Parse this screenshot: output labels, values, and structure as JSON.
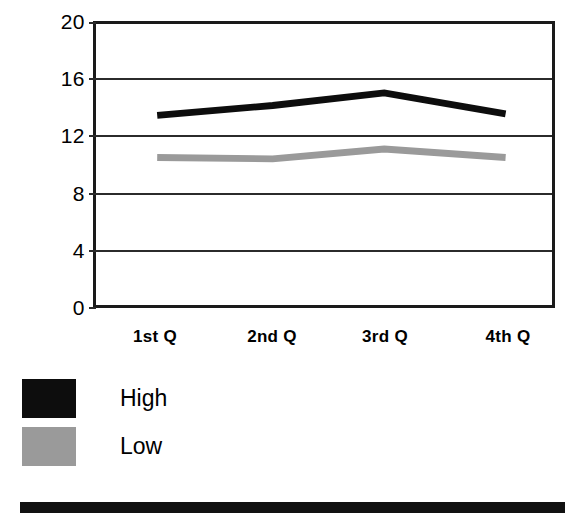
{
  "chart_data": {
    "type": "line",
    "title": "",
    "subtitle": "",
    "xlabel": "",
    "ylabel": "",
    "categories": [
      "1st Q",
      "2nd Q",
      "3rd Q",
      "4th Q"
    ],
    "series": [
      {
        "name": "High",
        "values": [
          13.5,
          14.2,
          15.1,
          13.6
        ],
        "color": "#0d0d0d"
      },
      {
        "name": "Low",
        "values": [
          10.5,
          10.4,
          11.1,
          10.5
        ],
        "color": "#9a9a9a"
      }
    ],
    "ylim": [
      0,
      20
    ],
    "yticks": [
      0,
      4,
      8,
      12,
      16,
      20
    ],
    "ytick_labels": [
      "0",
      "4",
      "8",
      "12",
      "16",
      "20"
    ],
    "grid": true,
    "grid_axis": "y",
    "legend_position": "bottom-left",
    "frame_color": "#1a1a1a",
    "background": "#ffffff"
  },
  "legend": {
    "entries": [
      {
        "label": "High",
        "swatch": "black-swatch"
      },
      {
        "label": "Low",
        "swatch": "gray-swatch"
      }
    ]
  },
  "footer": {
    "rule": ""
  }
}
